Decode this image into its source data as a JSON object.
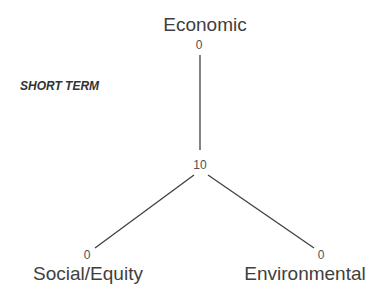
{
  "diagram": {
    "title": "SHORT TERM",
    "center_value": "10",
    "axes": [
      {
        "name": "Economic",
        "end_value": "0"
      },
      {
        "name": "Social/Equity",
        "end_value": "0"
      },
      {
        "name": "Environmental",
        "end_value": "0"
      }
    ],
    "line_color": "#404040"
  }
}
